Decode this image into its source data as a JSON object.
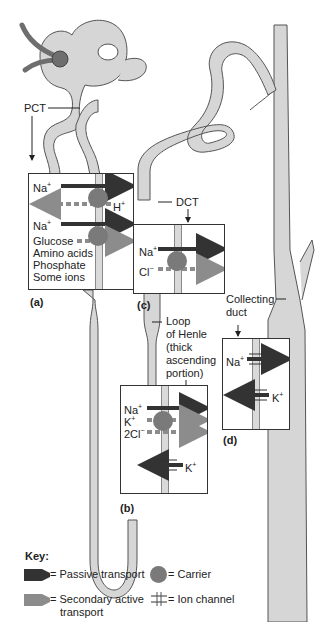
{
  "diagram": {
    "labels": {
      "pct": "PCT",
      "dct": "DCT",
      "loop": [
        "Loop",
        "of  Henle",
        "(thick",
        "ascending",
        "portion)"
      ],
      "collecting": [
        "Collecting",
        "duct"
      ]
    },
    "panels": {
      "a": {
        "letter": "(a)",
        "ions": {
          "na1": "Na",
          "na1_sup": "+",
          "h": "H",
          "h_sup": "+",
          "na2": "Na",
          "na2_sup": "+",
          "glucose": "Glucose",
          "amino": "Amino acids",
          "phosphate": "Phosphate",
          "some": "Some ions"
        }
      },
      "b": {
        "letter": "(b)",
        "ions": {
          "na": "Na",
          "na_sup": "+",
          "k": "K",
          "k_sup": "+",
          "cl": "2Cl",
          "cl_sup": "−",
          "k_out": "K",
          "k_out_sup": "+"
        }
      },
      "c": {
        "letter": "(c)",
        "ions": {
          "na": "Na",
          "na_sup": "+",
          "cl": "Cl",
          "cl_sup": "−"
        }
      },
      "d": {
        "letter": "(d)",
        "ions": {
          "na": "Na",
          "na_sup": "+",
          "k": "K",
          "k_sup": "+"
        }
      }
    },
    "key": {
      "title": "Key:",
      "passive": "= Passive transport",
      "carrier": "= Carrier",
      "secondary": "= Secondary active",
      "secondary2": "transport",
      "channel": "= Ion channel"
    },
    "colors": {
      "tubule_fill": "#d6d6d6",
      "tubule_stroke": "#555555",
      "afferent": "#6e6e6e",
      "passive_arrow": "#333333",
      "secondary_arrow": "#8c8c8c",
      "carrier": "#7a7a7a"
    }
  }
}
